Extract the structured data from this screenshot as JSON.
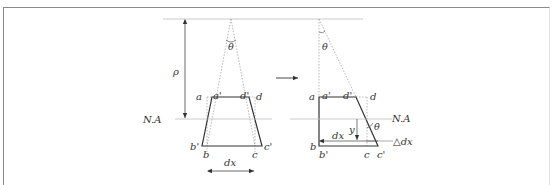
{
  "diagram": {
    "left_figure": {
      "labels": {
        "rho": "ρ",
        "theta": "θ",
        "a": "a",
        "a_prime": "a'",
        "d_prime": "d'",
        "d": "d",
        "neutral_axis": "N.A",
        "b_prime": "b'",
        "b": "b",
        "c": "c",
        "c_prime": "c'",
        "dx": "dx"
      }
    },
    "transition_arrow": "→",
    "right_figure": {
      "labels": {
        "theta_top": "θ",
        "a": "a",
        "a_prime": "a'",
        "d_prime": "d'",
        "d": "d",
        "neutral_axis": "N.A",
        "y": "y",
        "theta_side": "θ",
        "dx": "dx",
        "delta_dx": "△dx",
        "b": "b",
        "b_prime": "b'",
        "c": "c",
        "c_prime": "c'"
      }
    },
    "colors": {
      "solid_line": "#333333",
      "dotted_line": "#9a9a9a",
      "text": "#333333"
    }
  }
}
